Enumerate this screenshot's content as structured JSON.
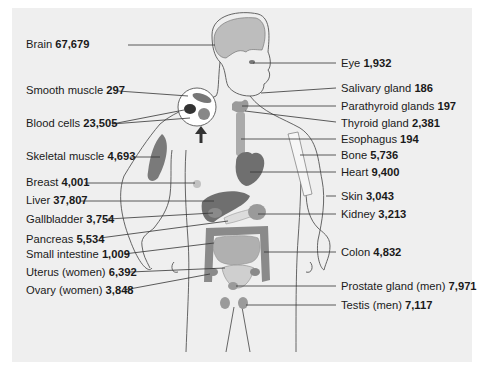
{
  "diagram": {
    "title": "",
    "left_labels": [
      {
        "id": "brain",
        "name": "Brain",
        "value": "67,679",
        "x": 26,
        "y": 38
      },
      {
        "id": "smooth-muscle",
        "name": "Smooth muscle",
        "value": "297",
        "x": 26,
        "y": 84
      },
      {
        "id": "blood-cells",
        "name": "Blood cells",
        "value": "23,505",
        "x": 26,
        "y": 117
      },
      {
        "id": "skeletal-muscle",
        "name": "Skeletal muscle",
        "value": "4,693",
        "x": 26,
        "y": 150
      },
      {
        "id": "breast",
        "name": "Breast",
        "value": "4,001",
        "x": 26,
        "y": 176
      },
      {
        "id": "liver",
        "name": "Liver",
        "value": "37,807",
        "x": 26,
        "y": 194
      },
      {
        "id": "gallbladder",
        "name": "Gallbladder",
        "value": "3,754",
        "x": 26,
        "y": 213
      },
      {
        "id": "pancreas",
        "name": "Pancreas",
        "value": "5,534",
        "x": 26,
        "y": 233
      },
      {
        "id": "small-intestine",
        "name": "Small intestine",
        "value": "1,009",
        "x": 26,
        "y": 248
      },
      {
        "id": "uterus",
        "name": "Uterus (women)",
        "value": "6,392",
        "x": 26,
        "y": 266
      },
      {
        "id": "ovary",
        "name": "Ovary (women)",
        "value": "3,848",
        "x": 26,
        "y": 284
      }
    ],
    "right_labels": [
      {
        "id": "eye",
        "name": "Eye",
        "value": "1,932",
        "x": 341,
        "y": 57
      },
      {
        "id": "salivary-gland",
        "name": "Salivary gland",
        "value": "186",
        "x": 341,
        "y": 82
      },
      {
        "id": "parathyroid-glands",
        "name": "Parathyroid glands",
        "value": "197",
        "x": 341,
        "y": 100
      },
      {
        "id": "thyroid-gland",
        "name": "Thyroid gland",
        "value": "2,381",
        "x": 341,
        "y": 117
      },
      {
        "id": "esophagus",
        "name": "Esophagus",
        "value": "194",
        "x": 341,
        "y": 133
      },
      {
        "id": "bone",
        "name": "Bone",
        "value": "5,736",
        "x": 341,
        "y": 149
      },
      {
        "id": "heart",
        "name": "Heart",
        "value": "9,400",
        "x": 341,
        "y": 166
      },
      {
        "id": "skin",
        "name": "Skin",
        "value": "3,043",
        "x": 341,
        "y": 190
      },
      {
        "id": "kidney",
        "name": "Kidney",
        "value": "3,213",
        "x": 341,
        "y": 208
      },
      {
        "id": "colon",
        "name": "Colon",
        "value": "4,832",
        "x": 341,
        "y": 246
      },
      {
        "id": "prostate-gland",
        "name": "Prostate gland (men)",
        "value": "7,971",
        "x": 341,
        "y": 280
      },
      {
        "id": "testis",
        "name": "Testis (men)",
        "value": "7,117",
        "x": 341,
        "y": 299
      }
    ],
    "colors": {
      "panel_bg": "#efefef",
      "page_bg": "#ffffff",
      "organ_dark": "#6f6f6f",
      "organ_mid": "#9a9a9a",
      "organ_light": "#bdbdbd",
      "outline": "#555555",
      "leader_line": "#333333",
      "text": "#1a1a1a"
    }
  }
}
